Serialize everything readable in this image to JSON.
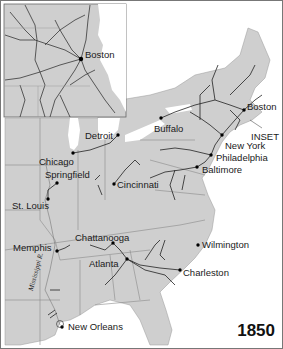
{
  "map": {
    "title_year": "1850",
    "subject": "Railroads of the eastern United States",
    "inset_label": "INSET",
    "inset_city": "Boston",
    "river_label": "Mississippi R.",
    "colors": {
      "land": "#cfcfcf",
      "water": "#ffffff",
      "rail": "#222222",
      "border": "#8a8a8a",
      "frame": "#555555"
    },
    "cities": [
      {
        "name": "Boston",
        "x": 244,
        "y": 110
      },
      {
        "name": "Buffalo",
        "x": 161,
        "y": 118
      },
      {
        "name": "New York",
        "x": 222,
        "y": 135
      },
      {
        "name": "Philadelphia",
        "x": 211,
        "y": 155
      },
      {
        "name": "Baltimore",
        "x": 197,
        "y": 167
      },
      {
        "name": "Detroit",
        "x": 118,
        "y": 135
      },
      {
        "name": "Chicago",
        "x": 73,
        "y": 153
      },
      {
        "name": "Springfield",
        "x": 57,
        "y": 183
      },
      {
        "name": "Cincinnati",
        "x": 114,
        "y": 184
      },
      {
        "name": "St. Louis",
        "x": 48,
        "y": 199
      },
      {
        "name": "Memphis",
        "x": 57,
        "y": 251
      },
      {
        "name": "Chattanooga",
        "x": 113,
        "y": 243
      },
      {
        "name": "Wilmington",
        "x": 198,
        "y": 245
      },
      {
        "name": "Atlanta",
        "x": 127,
        "y": 259
      },
      {
        "name": "Charleston",
        "x": 180,
        "y": 270
      },
      {
        "name": "New Orleans",
        "x": 62,
        "y": 327
      }
    ]
  }
}
